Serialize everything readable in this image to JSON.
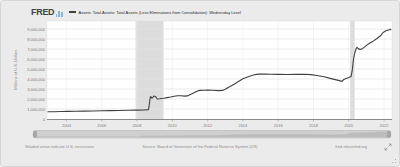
{
  "header": {
    "logo_text": "FRED",
    "legend_dash": "—",
    "series_title": "Assets: Total Assets: Total Assets (Less Eliminations from Consolidation): Wednesday Level"
  },
  "footer": {
    "recession_note": "Shaded areas indicate U.S. recessions",
    "source": "Source: Board of Governors of the Federal Reserve System (US)",
    "link": "fred.stlouisfed.org"
  },
  "icons": {
    "fred_logo_mark": "bar-chart-icon",
    "expand": "diagonal-expand-arrows",
    "resize_grip": "corner-dots"
  },
  "colors": {
    "line": "#404040",
    "recession_band": "#dcdcdc",
    "background": "#ebebeb",
    "plot_background": "#ffffff",
    "logo_accent": "#8ab4d8"
  },
  "chart_data": {
    "type": "line",
    "title": "Assets: Total Assets: Total Assets (Less Eliminations from Consolidation): Wednesday Level",
    "xlabel": "",
    "ylabel": "Millions of U.S. Dollars",
    "xlim": [
      2002.9,
      2022.45
    ],
    "ylim": [
      0,
      9200000
    ],
    "y_tick_step": 1000000,
    "y_tick_max": 9000000,
    "x_ticks": [
      2004,
      2006,
      2008,
      2010,
      2012,
      2014,
      2016,
      2018,
      2020,
      2022
    ],
    "grid": true,
    "legend_position": "top",
    "line_color": "#404040",
    "recession_color": "#dcdcdc",
    "recessions": [
      [
        2007.92,
        2009.5
      ],
      [
        2020.08,
        2020.33
      ]
    ],
    "series": [
      {
        "name": "Assets: Total Assets: Total Assets (Less Eliminations from Consolidation): Wednesday Level",
        "units": "Millions of U.S. Dollars",
        "points": [
          [
            2002.95,
            720000
          ],
          [
            2003.3,
            730000
          ],
          [
            2003.7,
            745000
          ],
          [
            2004.1,
            760000
          ],
          [
            2004.5,
            770000
          ],
          [
            2005.0,
            790000
          ],
          [
            2005.5,
            800000
          ],
          [
            2006.0,
            820000
          ],
          [
            2006.5,
            840000
          ],
          [
            2007.0,
            855000
          ],
          [
            2007.5,
            870000
          ],
          [
            2008.0,
            890000
          ],
          [
            2008.4,
            895000
          ],
          [
            2008.65,
            940000
          ],
          [
            2008.7,
            1500000
          ],
          [
            2008.74,
            2100000
          ],
          [
            2008.78,
            2250000
          ],
          [
            2008.84,
            2080000
          ],
          [
            2008.9,
            2150000
          ],
          [
            2008.95,
            2300000
          ],
          [
            2009.05,
            2250000
          ],
          [
            2009.15,
            2000000
          ],
          [
            2009.3,
            2030000
          ],
          [
            2009.5,
            2080000
          ],
          [
            2009.7,
            2140000
          ],
          [
            2009.9,
            2200000
          ],
          [
            2010.1,
            2280000
          ],
          [
            2010.3,
            2330000
          ],
          [
            2010.5,
            2320000
          ],
          [
            2010.7,
            2290000
          ],
          [
            2010.85,
            2310000
          ],
          [
            2011.0,
            2430000
          ],
          [
            2011.2,
            2600000
          ],
          [
            2011.4,
            2780000
          ],
          [
            2011.55,
            2860000
          ],
          [
            2011.8,
            2880000
          ],
          [
            2012.0,
            2900000
          ],
          [
            2012.3,
            2870000
          ],
          [
            2012.6,
            2840000
          ],
          [
            2012.85,
            2860000
          ],
          [
            2013.0,
            2980000
          ],
          [
            2013.25,
            3220000
          ],
          [
            2013.5,
            3480000
          ],
          [
            2013.75,
            3750000
          ],
          [
            2014.0,
            4030000
          ],
          [
            2014.3,
            4230000
          ],
          [
            2014.6,
            4400000
          ],
          [
            2014.85,
            4490000
          ],
          [
            2015.2,
            4500000
          ],
          [
            2015.6,
            4480000
          ],
          [
            2016.0,
            4460000
          ],
          [
            2016.5,
            4450000
          ],
          [
            2017.0,
            4460000
          ],
          [
            2017.5,
            4470000
          ],
          [
            2017.85,
            4440000
          ],
          [
            2018.2,
            4350000
          ],
          [
            2018.6,
            4220000
          ],
          [
            2019.0,
            4040000
          ],
          [
            2019.35,
            3890000
          ],
          [
            2019.62,
            3760000
          ],
          [
            2019.72,
            3960000
          ],
          [
            2019.85,
            4060000
          ],
          [
            2020.0,
            4160000
          ],
          [
            2020.13,
            4260000
          ],
          [
            2020.2,
            4900000
          ],
          [
            2020.27,
            6000000
          ],
          [
            2020.35,
            6650000
          ],
          [
            2020.42,
            7050000
          ],
          [
            2020.46,
            7170000
          ],
          [
            2020.55,
            7010000
          ],
          [
            2020.65,
            6960000
          ],
          [
            2020.8,
            7060000
          ],
          [
            2021.0,
            7360000
          ],
          [
            2021.2,
            7600000
          ],
          [
            2021.4,
            7810000
          ],
          [
            2021.6,
            8050000
          ],
          [
            2021.8,
            8320000
          ],
          [
            2021.95,
            8650000
          ],
          [
            2022.1,
            8820000
          ],
          [
            2022.25,
            8900000
          ],
          [
            2022.38,
            8960000
          ]
        ]
      }
    ]
  }
}
